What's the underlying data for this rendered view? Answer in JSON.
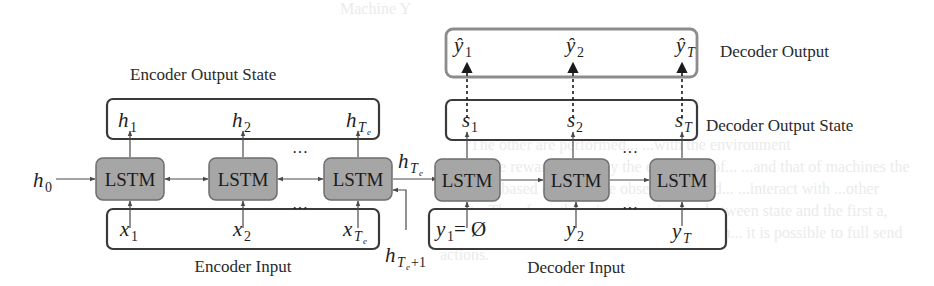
{
  "background_text": [
    "Machine Y",
    "Machine 1, Machine 0, ... h",
    "The other are performed...   ...with the environment",
    "Less more reward, and only the execution of...  ...and that of machines the",
    "next step based on machine observation and... ...interact with ...other",
    "agents. Therefore, there is a mapping... ...between state and the first a,",
    "which can correspond to the policy... ...action... it is possible to full send",
    "actions."
  ],
  "encoder": {
    "output_state_label": "Encoder Output State",
    "input_label": "Encoder Input",
    "cell_label": "LSTM",
    "outputs": [
      {
        "base": "h",
        "sub": "1",
        "subsub": ""
      },
      {
        "base": "h",
        "sub": "2",
        "subsub": ""
      },
      {
        "base": "h",
        "sub": "T",
        "subsub": "e"
      }
    ],
    "inputs": [
      {
        "base": "x",
        "sub": "1",
        "subsub": ""
      },
      {
        "base": "x",
        "sub": "2",
        "subsub": ""
      },
      {
        "base": "x",
        "sub": "T",
        "subsub": "e"
      }
    ],
    "initial_state": {
      "base": "h",
      "sub": "0"
    },
    "final_state": {
      "base": "h",
      "sub": "T",
      "subsub": "e"
    },
    "next_state": {
      "base": "h",
      "sub": "T",
      "subsub": "e",
      "suffix": "+1"
    },
    "ellipsis": "···"
  },
  "decoder": {
    "output_label": "Decoder Output",
    "output_state_label": "Decoder Output State",
    "input_label": "Decoder Input",
    "cell_label": "LSTM",
    "outputs": [
      {
        "base": "ŷ",
        "sub": "1"
      },
      {
        "base": "ŷ",
        "sub": "2"
      },
      {
        "base": "ŷ",
        "sub": "T"
      }
    ],
    "states": [
      {
        "base": "s",
        "sub": "1"
      },
      {
        "base": "s",
        "sub": "2"
      },
      {
        "base": "s",
        "sub": "T"
      }
    ],
    "inputs": [
      {
        "base": "y",
        "sub": "1",
        "suffix": " = Ø"
      },
      {
        "base": "y",
        "sub": "2",
        "suffix": ""
      },
      {
        "base": "y",
        "sub": "T",
        "suffix": ""
      }
    ],
    "ellipsis": "···"
  },
  "colors": {
    "lstm_fill": "#a6a6a6",
    "lstm_stroke": "#6e6e6e",
    "box_stroke": "#3a3a3a",
    "decoder_output_stroke": "#8c8c8c",
    "arrow": "#4a4a4a"
  }
}
